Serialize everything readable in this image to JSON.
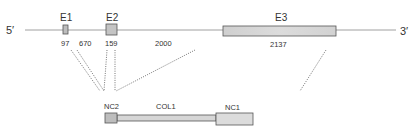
{
  "gene": {
    "five_prime": "5′",
    "three_prime": "3′",
    "exons": [
      {
        "label": "E1",
        "size": "97"
      },
      {
        "label": "E2",
        "size": "159"
      },
      {
        "label": "E3",
        "size": "2137"
      }
    ],
    "introns": [
      {
        "size": "670"
      },
      {
        "size": "2000"
      }
    ]
  },
  "protein": {
    "domains": [
      {
        "label": "NC2"
      },
      {
        "label": "COL1"
      },
      {
        "label": "NC1"
      }
    ]
  },
  "colors": {
    "line": "#777777",
    "box_fill": "#c8c8c8",
    "box_light": "#dedede",
    "box_stroke": "#555555",
    "dotted": "#666666"
  }
}
